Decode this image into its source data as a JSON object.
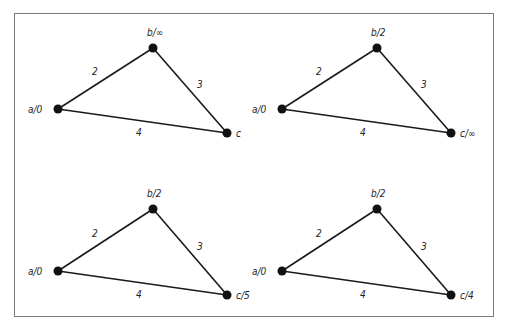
{
  "figure": {
    "panels": [
      {
        "id": "p1",
        "offset": [
          0,
          0
        ],
        "nodes": [
          {
            "id": "a",
            "label": "a/0",
            "x": 58,
            "y": 109,
            "lx": -30,
            "ly": 4
          },
          {
            "id": "b",
            "label": "b/∞",
            "x": 153,
            "y": 48,
            "lx": -6,
            "ly": -12
          },
          {
            "id": "c",
            "label": "c",
            "x": 227,
            "y": 133,
            "lx": 9,
            "ly": 4
          }
        ],
        "edges": [
          {
            "from": "a",
            "to": "b",
            "weight": "2",
            "wx": 92,
            "wy": 75
          },
          {
            "from": "b",
            "to": "c",
            "weight": "3",
            "wx": 197,
            "wy": 88
          },
          {
            "from": "a",
            "to": "c",
            "weight": "4",
            "wx": 136,
            "wy": 136
          }
        ]
      },
      {
        "id": "p2",
        "offset": [
          0,
          0
        ],
        "nodes": [
          {
            "id": "a",
            "label": "a/0",
            "x": 282,
            "y": 109,
            "lx": -30,
            "ly": 4
          },
          {
            "id": "b",
            "label": "b/2",
            "x": 377,
            "y": 48,
            "lx": -6,
            "ly": -12
          },
          {
            "id": "c",
            "label": "c/∞",
            "x": 451,
            "y": 133,
            "lx": 9,
            "ly": 4
          }
        ],
        "edges": [
          {
            "from": "a",
            "to": "b",
            "weight": "2",
            "wx": 316,
            "wy": 75
          },
          {
            "from": "b",
            "to": "c",
            "weight": "3",
            "wx": 421,
            "wy": 88
          },
          {
            "from": "a",
            "to": "c",
            "weight": "4",
            "wx": 360,
            "wy": 136
          }
        ]
      },
      {
        "id": "p3",
        "offset": [
          0,
          0
        ],
        "nodes": [
          {
            "id": "a",
            "label": "a/0",
            "x": 58,
            "y": 271,
            "lx": -30,
            "ly": 4
          },
          {
            "id": "b",
            "label": "b/2",
            "x": 153,
            "y": 209,
            "lx": -6,
            "ly": -12
          },
          {
            "id": "c",
            "label": "c/5",
            "x": 227,
            "y": 295,
            "lx": 9,
            "ly": 4
          }
        ],
        "edges": [
          {
            "from": "a",
            "to": "b",
            "weight": "2",
            "wx": 92,
            "wy": 237
          },
          {
            "from": "b",
            "to": "c",
            "weight": "3",
            "wx": 197,
            "wy": 250
          },
          {
            "from": "a",
            "to": "c",
            "weight": "4",
            "wx": 136,
            "wy": 298
          }
        ]
      },
      {
        "id": "p4",
        "offset": [
          0,
          0
        ],
        "nodes": [
          {
            "id": "a",
            "label": "a/0",
            "x": 282,
            "y": 271,
            "lx": -30,
            "ly": 4
          },
          {
            "id": "b",
            "label": "b/2",
            "x": 377,
            "y": 209,
            "lx": -6,
            "ly": -12
          },
          {
            "id": "c",
            "label": "c/4",
            "x": 451,
            "y": 295,
            "lx": 9,
            "ly": 4
          }
        ],
        "edges": [
          {
            "from": "a",
            "to": "b",
            "weight": "2",
            "wx": 316,
            "wy": 237
          },
          {
            "from": "b",
            "to": "c",
            "weight": "3",
            "wx": 421,
            "wy": 250
          },
          {
            "from": "a",
            "to": "c",
            "weight": "4",
            "wx": 360,
            "wy": 298
          }
        ]
      }
    ]
  }
}
